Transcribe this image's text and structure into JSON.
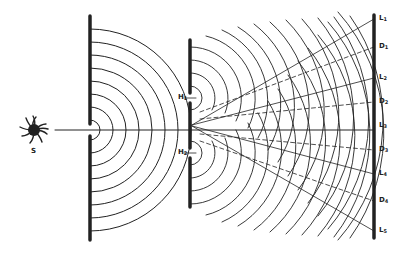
{
  "figure": {
    "source_label": "S",
    "slit_labels": [
      {
        "base": "H",
        "sub": "1"
      },
      {
        "base": "H",
        "sub": "2"
      }
    ],
    "screen_labels": [
      {
        "base": "L",
        "sub": "1",
        "y": 19
      },
      {
        "base": "D",
        "sub": "1",
        "y": 47
      },
      {
        "base": "L",
        "sub": "2",
        "y": 78
      },
      {
        "base": "D",
        "sub": "2",
        "y": 102
      },
      {
        "base": "L",
        "sub": "3",
        "y": 126
      },
      {
        "base": "D",
        "sub": "3",
        "y": 150
      },
      {
        "base": "L",
        "sub": "4",
        "y": 174
      },
      {
        "base": "D",
        "sub": "4",
        "y": 201
      },
      {
        "base": "L",
        "sub": "5",
        "y": 231
      }
    ],
    "colors": {
      "ink": "#222222",
      "background": "#ffffff"
    }
  }
}
